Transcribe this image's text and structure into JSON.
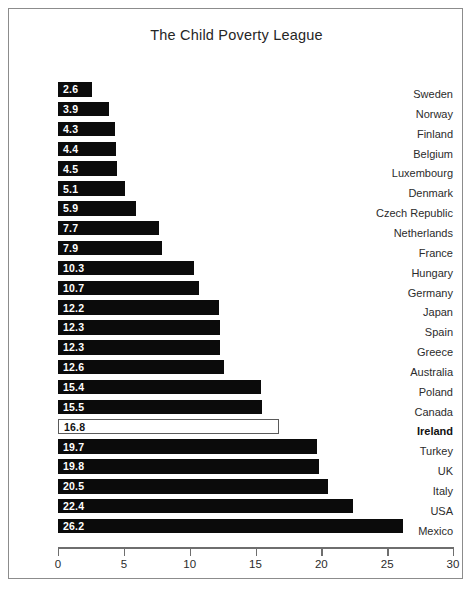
{
  "chart_data": {
    "type": "bar",
    "orientation": "horizontal",
    "title": "The Child Poverty League",
    "xlabel": "",
    "ylabel": "",
    "xlim": [
      0,
      30
    ],
    "xticks": [
      0,
      5,
      10,
      15,
      20,
      25,
      30
    ],
    "grid": false,
    "legend": null,
    "highlight_category": "Ireland",
    "categories": [
      "Sweden",
      "Norway",
      "Finland",
      "Belgium",
      "Luxembourg",
      "Denmark",
      "Czech Republic",
      "Netherlands",
      "France",
      "Hungary",
      "Germany",
      "Japan",
      "Spain",
      "Greece",
      "Australia",
      "Poland",
      "Canada",
      "Ireland",
      "Turkey",
      "UK",
      "Italy",
      "USA",
      "Mexico"
    ],
    "values": [
      2.6,
      3.9,
      4.3,
      4.4,
      4.5,
      5.1,
      5.9,
      7.7,
      7.9,
      10.3,
      10.7,
      12.2,
      12.3,
      12.3,
      12.6,
      15.4,
      15.5,
      16.8,
      19.7,
      19.8,
      20.5,
      22.4,
      26.2
    ],
    "value_labels": [
      "2.6",
      "3.9",
      "4.3",
      "4.4",
      "4.5",
      "5.1",
      "5.9",
      "7.7",
      "7.9",
      "10.3",
      "10.7",
      "12.2",
      "12.3",
      "12.3",
      "12.6",
      "15.4",
      "15.5",
      "16.8",
      "19.7",
      "19.8",
      "20.5",
      "22.4",
      "26.2"
    ],
    "tick_labels": [
      "0",
      "5",
      "10",
      "15",
      "20",
      "25",
      "30"
    ],
    "colors": {
      "bar": "#0b0b0b",
      "bar_highlight_fill": "#ffffff",
      "bar_highlight_stroke": "#5a5a5a",
      "value_text": "#ffffff",
      "value_text_highlight": "#111111",
      "axis": "#6e6e6e",
      "frame": "#8c8c8c",
      "text": "#2b2b2b",
      "background": "#ffffff"
    }
  }
}
